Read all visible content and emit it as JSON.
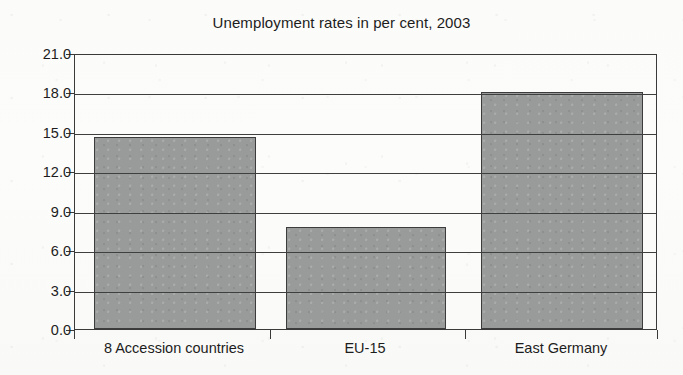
{
  "chart_data": {
    "type": "bar",
    "title": "Unemployment rates in per cent, 2003",
    "xlabel": "",
    "ylabel": "",
    "categories": [
      "8 Accession countries",
      "EU-15",
      "East Germany"
    ],
    "values": [
      14.6,
      7.8,
      18.0
    ],
    "ylim": [
      0.0,
      21.0
    ],
    "ytick_labels": [
      "21.0",
      "18.0",
      "15.0",
      "12.0",
      "9.0",
      "6.0",
      "3.0",
      "0.0"
    ],
    "ytick_values": [
      21.0,
      18.0,
      15.0,
      12.0,
      9.0,
      6.0,
      3.0,
      0.0
    ],
    "grid": true,
    "legend": "none",
    "bar_color": "#999a9a",
    "axis_color": "#3a3a3a",
    "background_color": "#fdfdfb"
  }
}
